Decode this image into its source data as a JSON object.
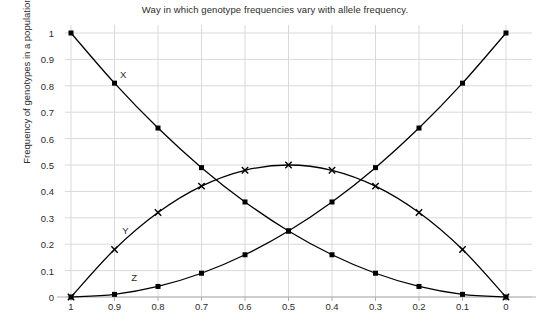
{
  "chart_data": {
    "type": "line",
    "title": "Way in which genotype frequencies vary with allele frequency.",
    "xlabel": "",
    "ylabel": "Frequency of genotypes in a population",
    "x": [
      1,
      0.9,
      0.8,
      0.7,
      0.6,
      0.5,
      0.4,
      0.3,
      0.2,
      0.1,
      0
    ],
    "x_tick_labels": [
      "1",
      "0.9",
      "0.8",
      "0.7",
      "0.6",
      "0.5",
      "0.4",
      "0.3",
      "0.2",
      "0.1",
      "0"
    ],
    "y_tick_labels": [
      "1",
      "0.9",
      "0.8",
      "0.7",
      "0.6",
      "0.5",
      "0.4",
      "0.3",
      "0.2",
      "0.1",
      "0"
    ],
    "y_ticks": [
      1,
      0.9,
      0.8,
      0.7,
      0.6,
      0.5,
      0.4,
      0.3,
      0.2,
      0.1,
      0
    ],
    "xlim": [
      1,
      0
    ],
    "ylim": [
      0,
      1
    ],
    "x_axis_reversed": true,
    "grid": true,
    "grid_color": "#d9d9d9",
    "line_color": "#000000",
    "legend_position": "inline-labels",
    "series": [
      {
        "name": "X",
        "marker": "square",
        "label_x": 0.88,
        "label_y": 0.845,
        "values": [
          1,
          0.81,
          0.64,
          0.49,
          0.36,
          0.25,
          0.16,
          0.09,
          0.04,
          0.01,
          0
        ]
      },
      {
        "name": "Y",
        "marker": "cross",
        "label_x": 0.875,
        "label_y": 0.255,
        "values": [
          0,
          0.18,
          0.32,
          0.42,
          0.48,
          0.5,
          0.48,
          0.42,
          0.32,
          0.18,
          0
        ]
      },
      {
        "name": "Z",
        "marker": "square",
        "label_x": 0.855,
        "label_y": 0.075,
        "values": [
          0,
          0.01,
          0.04,
          0.09,
          0.16,
          0.25,
          0.36,
          0.49,
          0.64,
          0.81,
          1
        ]
      }
    ]
  }
}
